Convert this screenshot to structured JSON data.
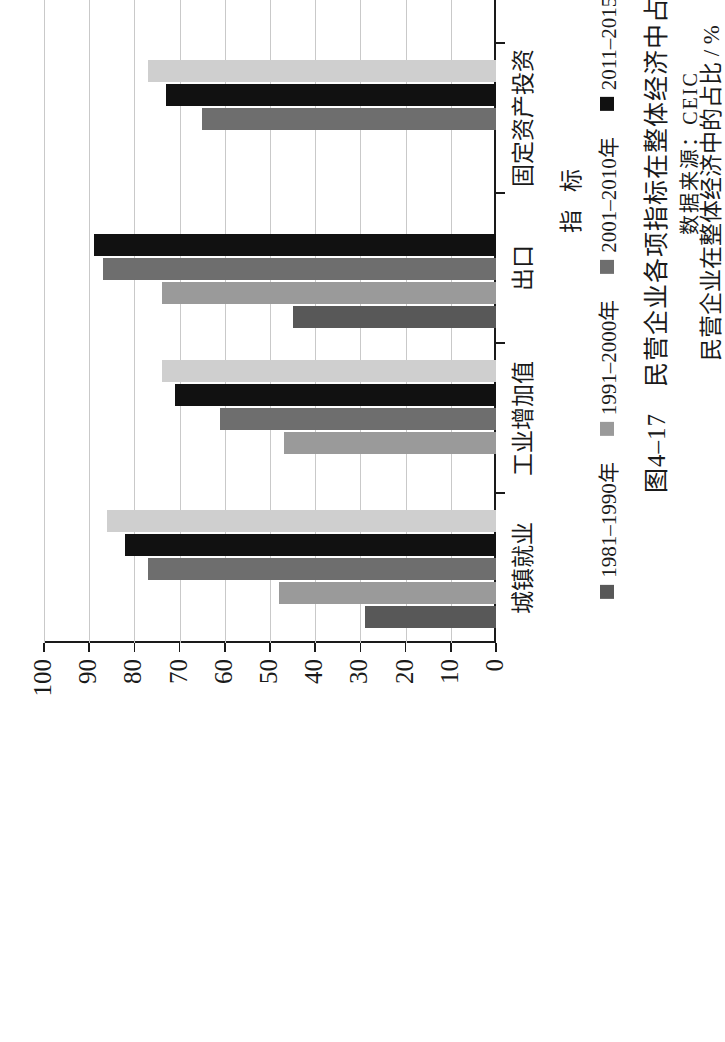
{
  "figure": {
    "caption": "图4–17　民营企业各项指标在整体经济中占比的对比",
    "source": "数据来源：CEIC",
    "value_axis_title": "民营企业在整体经济中的占比 / %",
    "category_axis_title": "指 标"
  },
  "chart_data": {
    "type": "bar",
    "orientation": "vertical-grouped",
    "title": "图4–17　民营企业各项指标在整体经济中占比的对比",
    "xlabel": "指 标",
    "ylabel": "民营企业在整体经济中的占比 / %",
    "ylim": [
      0,
      100
    ],
    "ytick_labels": [
      "0",
      "10",
      "20",
      "30",
      "40",
      "50",
      "60",
      "70",
      "80",
      "90",
      "100"
    ],
    "ytick_values": [
      0,
      10,
      20,
      30,
      40,
      50,
      60,
      70,
      80,
      90,
      100
    ],
    "grid": "y-only",
    "legend_position": "bottom",
    "categories": [
      "城镇就业",
      "工业增加值",
      "出口",
      "固定资产投资",
      "专利",
      "企业债务"
    ],
    "series": [
      {
        "name": "1981–1990年",
        "color": "#585858",
        "values": [
          29,
          null,
          45,
          null,
          null,
          22
        ]
      },
      {
        "name": "1991–2000年",
        "color": "#9a9a9a",
        "values": [
          48,
          47,
          74,
          null,
          null,
          null
        ]
      },
      {
        "name": "2001–2010年",
        "color": "#6e6e6e",
        "values": [
          77,
          61,
          87,
          65,
          65,
          null
        ]
      },
      {
        "name": "2011–2015年",
        "color": "#111111",
        "values": [
          82,
          71,
          89,
          73,
          68,
          16
        ]
      },
      {
        "name": "2016–2019年",
        "color": "#cfcfcf",
        "values": [
          86,
          74,
          null,
          77,
          75,
          17
        ]
      }
    ]
  }
}
